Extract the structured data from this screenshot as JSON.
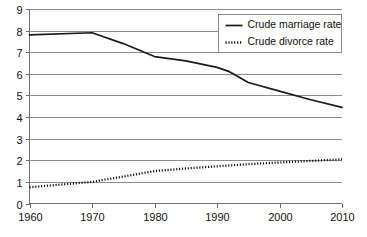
{
  "chart_data": {
    "type": "line",
    "title": "",
    "xlabel": "",
    "ylabel": "",
    "xlim": [
      1960,
      2010
    ],
    "ylim": [
      0,
      9
    ],
    "grid": true,
    "legend_position": "top-right",
    "x_ticks": [
      "1960",
      "1970",
      "1980",
      "1990",
      "2000",
      "2010"
    ],
    "y_ticks": [
      "0",
      "1",
      "2",
      "3",
      "4",
      "5",
      "6",
      "7",
      "8",
      "9"
    ],
    "x": [
      1960,
      1970,
      1975,
      1980,
      1985,
      1990,
      1992,
      1995,
      2000,
      2005,
      2010
    ],
    "series": [
      {
        "name": "Crude marriage rate",
        "style": "solid",
        "color": "#1a1a1a",
        "values": [
          7.8,
          7.9,
          7.4,
          6.8,
          6.6,
          6.3,
          6.1,
          5.6,
          5.2,
          4.8,
          4.45
        ]
      },
      {
        "name": "Crude divorce rate",
        "style": "dotted",
        "color": "#111111",
        "values": [
          0.75,
          1.0,
          1.25,
          1.5,
          1.62,
          1.72,
          1.76,
          1.82,
          1.9,
          1.97,
          2.05
        ]
      }
    ]
  },
  "legend": {
    "entries": [
      {
        "label": "Crude marriage rate",
        "style": "solid"
      },
      {
        "label": "Crude divorce rate",
        "style": "dotted"
      }
    ]
  },
  "colors": {
    "background": "#ffffff",
    "grid": "#8d8d8d",
    "axis": "#6f6f6f",
    "text": "#111111",
    "marriage_line": "#1a1a1a",
    "divorce_line": "#111111"
  }
}
